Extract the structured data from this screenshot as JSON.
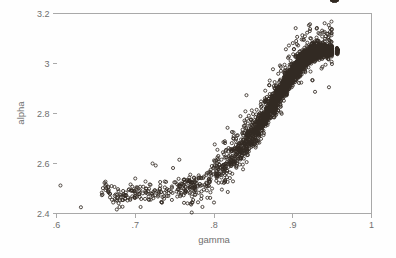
{
  "figure": {
    "kind": "scatter-plot",
    "background_color": "#fefefe",
    "frame_color": "#a9a9a9",
    "marker_color": "#332b24",
    "text_color": "#6e6e6e"
  },
  "chart_data": {
    "type": "scatter",
    "title": "",
    "subtitle": "",
    "xlabel": "gamma",
    "ylabel": "alpha",
    "xlim": [
      0.6,
      1.0
    ],
    "ylim": [
      2.4,
      3.2
    ],
    "xticks": [
      0.6,
      0.7,
      0.8,
      0.9,
      1.0
    ],
    "xticklabels": [
      ".6",
      ".7",
      ".8",
      ".9",
      "1"
    ],
    "yticks": [
      2.4,
      2.6,
      2.8,
      3.0,
      3.2
    ],
    "yticklabels": [
      "2.4",
      "2.6",
      "2.8",
      "3",
      "3.2"
    ],
    "grid": false,
    "legend": null,
    "legend_position": "none",
    "marker": "open-circle",
    "marker_size": 3,
    "n_points": 3000,
    "x": [
      0.605,
      0.631,
      0.662,
      0.668,
      0.672,
      0.676,
      0.681,
      0.684,
      0.687,
      0.691,
      0.694,
      0.697,
      0.7,
      0.703,
      0.706,
      0.709,
      0.712,
      0.714,
      0.717,
      0.719,
      0.722,
      0.724,
      0.726,
      0.728,
      0.73,
      0.732,
      0.734,
      0.736,
      0.738,
      0.74,
      0.742,
      0.744,
      0.746,
      0.748,
      0.75,
      0.752,
      0.754,
      0.756,
      0.758,
      0.76,
      0.762,
      0.764,
      0.766,
      0.768,
      0.77,
      0.772,
      0.774,
      0.776,
      0.778,
      0.78,
      0.782,
      0.784,
      0.786,
      0.788,
      0.79,
      0.792,
      0.794,
      0.796,
      0.798,
      0.8,
      0.802,
      0.804,
      0.806,
      0.808,
      0.81,
      0.812,
      0.814,
      0.816,
      0.818,
      0.82,
      0.822,
      0.824,
      0.826,
      0.828,
      0.83,
      0.832,
      0.834,
      0.836,
      0.838,
      0.84,
      0.842,
      0.844,
      0.846,
      0.848,
      0.85,
      0.852,
      0.854,
      0.856,
      0.858,
      0.86,
      0.862,
      0.864,
      0.866,
      0.868,
      0.87,
      0.872,
      0.874,
      0.876,
      0.878,
      0.88,
      0.882,
      0.884,
      0.886,
      0.888,
      0.89,
      0.892,
      0.894,
      0.896,
      0.898,
      0.9,
      0.902,
      0.904,
      0.906,
      0.908,
      0.91,
      0.912,
      0.914,
      0.916,
      0.918,
      0.92,
      0.922,
      0.924,
      0.926,
      0.928,
      0.93,
      0.932,
      0.934,
      0.936,
      0.938,
      0.94,
      0.942,
      0.944,
      0.946,
      0.948,
      0.95,
      0.952,
      0.954,
      0.956
    ],
    "y_center": [
      2.512,
      2.425,
      2.5,
      2.478,
      2.468,
      2.462,
      2.47,
      2.465,
      2.472,
      2.48,
      2.476,
      2.47,
      2.474,
      2.478,
      2.472,
      2.47,
      2.475,
      2.48,
      2.478,
      2.482,
      2.48,
      2.484,
      2.482,
      2.486,
      2.484,
      2.488,
      2.486,
      2.49,
      2.489,
      2.492,
      2.491,
      2.494,
      2.493,
      2.496,
      2.495,
      2.499,
      2.498,
      2.502,
      2.501,
      2.505,
      2.504,
      2.508,
      2.508,
      2.512,
      2.512,
      2.516,
      2.517,
      2.521,
      2.522,
      2.526,
      2.528,
      2.532,
      2.534,
      2.539,
      2.541,
      2.546,
      2.549,
      2.554,
      2.557,
      2.562,
      2.566,
      2.571,
      2.575,
      2.581,
      2.585,
      2.591,
      2.596,
      2.602,
      2.607,
      2.613,
      2.619,
      2.626,
      2.632,
      2.639,
      2.645,
      2.652,
      2.659,
      2.667,
      2.674,
      2.681,
      2.689,
      2.697,
      2.705,
      2.713,
      2.721,
      2.73,
      2.738,
      2.747,
      2.756,
      2.765,
      2.774,
      2.783,
      2.793,
      2.802,
      2.812,
      2.822,
      2.831,
      2.841,
      2.851,
      2.861,
      2.871,
      2.881,
      2.891,
      2.901,
      2.911,
      2.921,
      2.931,
      2.94,
      2.95,
      2.959,
      2.968,
      2.977,
      2.985,
      2.993,
      3.001,
      3.008,
      3.014,
      3.02,
      3.026,
      3.031,
      3.035,
      3.039,
      3.042,
      3.045,
      3.047,
      3.049,
      3.05,
      3.051,
      3.052,
      3.052,
      3.052,
      3.052,
      3.051,
      3.05,
      3.049
    ]
  }
}
